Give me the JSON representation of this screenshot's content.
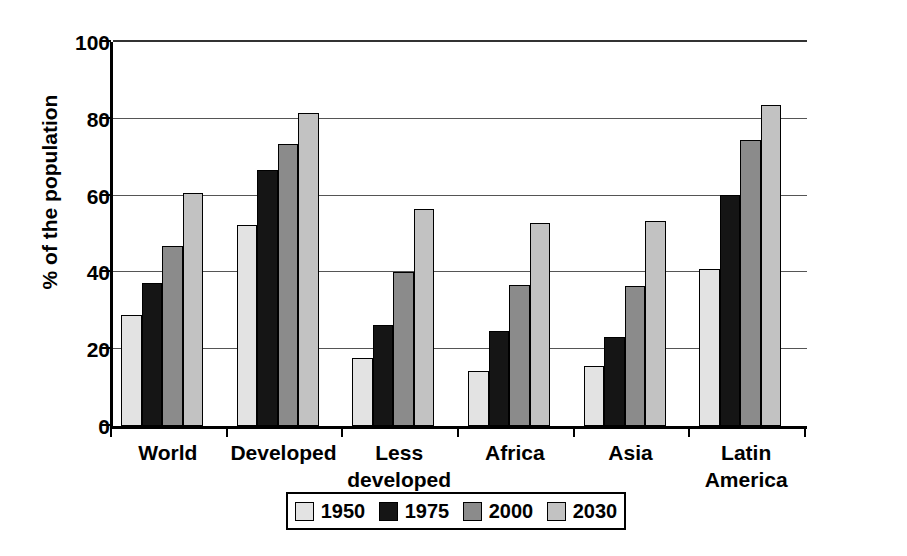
{
  "chart_data": {
    "type": "bar",
    "title": "",
    "subtitle": "",
    "xlabel": "",
    "ylabel": "% of the population",
    "ylim": [
      0,
      100
    ],
    "yticks": [
      0,
      20,
      40,
      60,
      80,
      100
    ],
    "ytick_labels": [
      "0",
      "20",
      "40",
      "60",
      "80",
      "100"
    ],
    "grid": "horizontal",
    "legend_position": "bottom-center",
    "categories": [
      "World",
      "Developed",
      "Less developed",
      "Africa",
      "Asia",
      "Latin America"
    ],
    "category_lines": [
      [
        "World"
      ],
      [
        "Developed"
      ],
      [
        "Less",
        "developed"
      ],
      [
        "Africa"
      ],
      [
        "Asia"
      ],
      [
        "Latin",
        "America"
      ]
    ],
    "series": [
      {
        "name": "1950",
        "color": "#e3e3e3",
        "values": [
          29.0,
          52.3,
          17.8,
          14.3,
          15.7,
          41.0
        ]
      },
      {
        "name": "1975",
        "color": "#151515",
        "values": [
          37.3,
          66.8,
          26.3,
          24.8,
          23.3,
          60.2
        ]
      },
      {
        "name": "2000",
        "color": "#8b8b8b",
        "values": [
          47.0,
          73.5,
          40.2,
          36.6,
          36.5,
          74.4
        ]
      },
      {
        "name": "2030",
        "color": "#c2c2c2",
        "values": [
          60.6,
          81.5,
          56.6,
          52.8,
          53.5,
          83.5
        ]
      }
    ]
  },
  "legend": {
    "items": [
      {
        "label": "1950",
        "swatch_name": "legend-swatch-1950"
      },
      {
        "label": "1975",
        "swatch_name": "legend-swatch-1975"
      },
      {
        "label": "2000",
        "swatch_name": "legend-swatch-2000"
      },
      {
        "label": "2030",
        "swatch_name": "legend-swatch-2030"
      }
    ]
  }
}
